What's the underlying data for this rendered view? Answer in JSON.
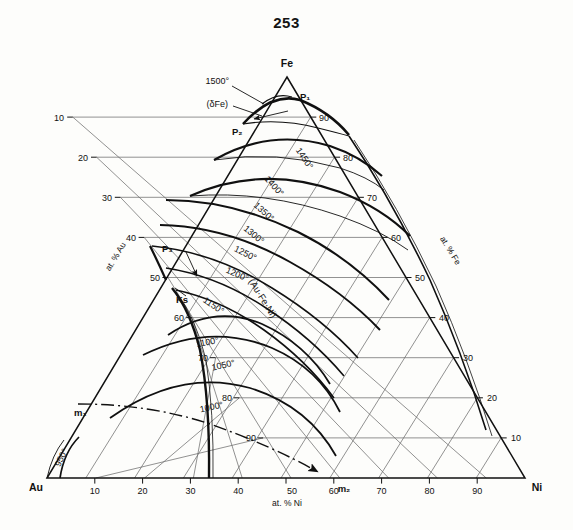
{
  "page": {
    "number": "253"
  },
  "figure": {
    "type": "ternary-phase-diagram",
    "corners": {
      "top": "Fe",
      "left": "Au",
      "right": "Ni"
    },
    "axes": {
      "left": {
        "label": "at. % Au",
        "ticks": [
          "10",
          "20",
          "30",
          "40",
          "50",
          "60",
          "70",
          "80",
          "90"
        ]
      },
      "right": {
        "label": "at. % Fe",
        "ticks": [
          "90",
          "80",
          "70",
          "60",
          "50",
          "40",
          "30",
          "20",
          "10"
        ]
      },
      "bottom": {
        "label": "at. % Ni",
        "ticks": [
          "10",
          "20",
          "30",
          "40",
          "50",
          "60",
          "70",
          "80",
          "90"
        ]
      }
    },
    "isotherms": [
      {
        "label": "1500°"
      },
      {
        "label": "1450°"
      },
      {
        "label": "1400°"
      },
      {
        "label": "1350°"
      },
      {
        "label": "1300°"
      },
      {
        "label": "1250°"
      },
      {
        "label": "1200°"
      },
      {
        "label": "1150°"
      },
      {
        "label": "1100°"
      },
      {
        "label": "1050°"
      },
      {
        "label": "1000°"
      },
      {
        "label": "950°"
      }
    ],
    "phase_labels": [
      {
        "id": "delta-fe",
        "label": "(δFe)"
      },
      {
        "id": "au-fe-ni",
        "label": "(Au·Fe·Ni)"
      }
    ],
    "points": [
      {
        "id": "p1",
        "label": "P₁"
      },
      {
        "id": "p2",
        "label": "P₂"
      },
      {
        "id": "p3",
        "label": "P₃"
      },
      {
        "id": "ks",
        "label": "Ks"
      },
      {
        "id": "m1",
        "label": "m₁"
      },
      {
        "id": "m2",
        "label": "m₂"
      }
    ],
    "colors": {
      "grid": "#6d6d6d",
      "curve": "#101010",
      "text": "#111111",
      "background": "#fdfdfb"
    }
  }
}
